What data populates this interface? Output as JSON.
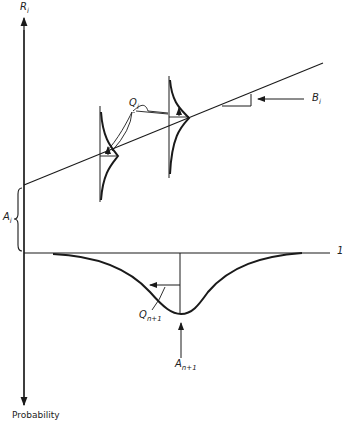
{
  "diagram": {
    "axes": {
      "vertical_top_label": "R",
      "vertical_top_sub": "i",
      "vertical_bottom_label": "Probability",
      "horizontal_right_label": "1"
    },
    "labels": {
      "intercept": "A",
      "intercept_sub": "i",
      "slope": "B",
      "slope_sub": "i",
      "distribution": "Q",
      "distribution_sub": "i",
      "next_distribution": "Q",
      "next_distribution_sub": "n+1",
      "next_mean": "A",
      "next_mean_sub": "n+1"
    },
    "colors": {
      "ink": "#1a1a1a",
      "background": "#ffffff"
    }
  }
}
